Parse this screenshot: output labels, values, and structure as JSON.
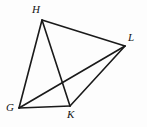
{
  "figure": {
    "kind": "geometry-diagram",
    "width": 147,
    "height": 127,
    "background_color": "#fdfdfd",
    "stroke_color": "#1a1a1a",
    "stroke_width": 1.6,
    "label_color": "#141414"
  },
  "vertices": [
    {
      "name": "H",
      "label": "H",
      "x": 42,
      "y": 20,
      "label_x": 32,
      "label_y": 4
    },
    {
      "name": "L",
      "label": "L",
      "x": 125,
      "y": 46,
      "label_x": 128,
      "label_y": 32
    },
    {
      "name": "G",
      "label": "G",
      "x": 19,
      "y": 108,
      "label_x": 6,
      "label_y": 102
    },
    {
      "name": "K",
      "label": "K",
      "x": 70,
      "y": 106,
      "label_x": 67,
      "label_y": 109
    }
  ],
  "segments": [
    {
      "name": "segment-GH",
      "from": "G",
      "to": "H",
      "x1": 19,
      "y1": 108,
      "x2": 42,
      "y2": 20,
      "role": "side"
    },
    {
      "name": "segment-HL",
      "from": "H",
      "to": "L",
      "x1": 42,
      "y1": 20,
      "x2": 125,
      "y2": 46,
      "role": "side"
    },
    {
      "name": "segment-LK",
      "from": "L",
      "to": "K",
      "x1": 125,
      "y1": 46,
      "x2": 70,
      "y2": 106,
      "role": "side"
    },
    {
      "name": "segment-KG",
      "from": "K",
      "to": "G",
      "x1": 70,
      "y1": 106,
      "x2": 19,
      "y2": 108,
      "role": "side"
    },
    {
      "name": "segment-HK",
      "from": "H",
      "to": "K",
      "x1": 42,
      "y1": 20,
      "x2": 70,
      "y2": 106,
      "role": "diagonal"
    },
    {
      "name": "segment-GL",
      "from": "G",
      "to": "L",
      "x1": 19,
      "y1": 108,
      "x2": 125,
      "y2": 46,
      "role": "diagonal"
    }
  ]
}
